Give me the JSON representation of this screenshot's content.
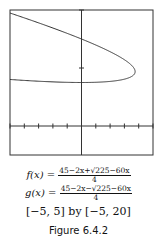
{
  "chart_data": {
    "type": "line",
    "title": "",
    "xlabel": "",
    "ylabel": "",
    "xlim": [
      -5,
      5
    ],
    "ylim": [
      -5,
      20
    ],
    "x_tick_step": 1,
    "y_tick_step": 10,
    "grid": false,
    "series": [
      {
        "name": "f(x)",
        "expression": "(45-2x+sqrt(225-60x))/4",
        "x": [
          -5,
          -4,
          -3,
          -2,
          -1,
          0,
          1,
          2,
          3,
          3.5,
          3.75
        ],
        "values": [
          19.98,
          19.1,
          18.19,
          17.26,
          16.29,
          15.0,
          13.87,
          12.59,
          11.12,
          10.18,
          9.375
        ]
      },
      {
        "name": "g(x)",
        "expression": "(45-2x-sqrt(225-60x))/4",
        "x": [
          -5,
          -4,
          -3,
          -2,
          -1,
          0,
          1,
          2,
          3,
          3.5,
          3.75
        ],
        "values": [
          7.52,
          7.9,
          8.31,
          8.74,
          9.21,
          7.5,
          8.63,
          8.91,
          9.13,
          9.07,
          9.375
        ]
      }
    ]
  },
  "caption": {
    "f_lhs": "f(x) = ",
    "f_num": "45−2x+√225−60x",
    "f_den": "4",
    "g_lhs": "g(x) = ",
    "g_num": "45−2x−√225−60x",
    "g_den": "4",
    "window": "[−5, 5] by [−5, 20]",
    "figure_label": "Figure 6.4.2"
  }
}
